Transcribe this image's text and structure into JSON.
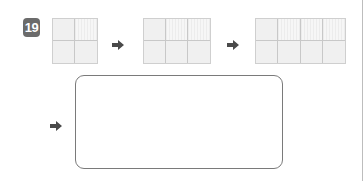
{
  "problem": {
    "number": "19",
    "badge_color": "#6b6b6b"
  },
  "sequence": [
    {
      "cols": 2,
      "rows": 2,
      "hatched": [
        1
      ],
      "left": 52,
      "width": 46
    },
    {
      "cols": 3,
      "rows": 2,
      "hatched": [
        1,
        2
      ],
      "left": 143,
      "width": 68
    },
    {
      "cols": 4,
      "rows": 2,
      "hatched": [
        1,
        2,
        3
      ],
      "left": 255,
      "width": 91
    }
  ],
  "arrows": [
    {
      "left": 112,
      "top": 36
    },
    {
      "left": 227,
      "top": 36
    },
    {
      "left": 50,
      "top": 117
    }
  ],
  "answer_box": {
    "content": ""
  },
  "colors": {
    "arrow": "#4a4a4a",
    "grid_line": "#c8c8c8",
    "box_border": "#7a7a7a"
  }
}
